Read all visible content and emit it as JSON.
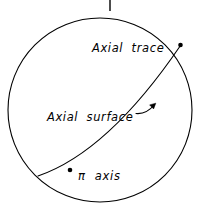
{
  "figure": {
    "type": "stereographic-projection-diagram",
    "width": 213,
    "height": 218,
    "background_color": "#ffffff",
    "stroke_color": "#000000"
  },
  "primitive_circle": {
    "name": "primitive-circle",
    "center_x": 100,
    "center_y": 110,
    "radius": 92,
    "stroke_width": 1.1
  },
  "north_tick": {
    "name": "north-index-tick",
    "x": 110,
    "y_top": 0,
    "y_bottom": 11,
    "stroke_width": 1.4
  },
  "great_circle": {
    "name": "axial-surface-great-circle",
    "start_point": {
      "x": 180.5,
      "y": 45.5
    },
    "end_point": {
      "x": 38.0,
      "y": 176.0
    },
    "control_point": {
      "x": 108.0,
      "y": 152.0
    },
    "stroke_width": 1.1
  },
  "markers": [
    {
      "name": "axial-trace-point",
      "x": 180.5,
      "y": 45.0,
      "radius": 2.3
    },
    {
      "name": "pi-axis-point",
      "x": 70.0,
      "y": 170.0,
      "radius": 2.3
    }
  ],
  "arrow": {
    "name": "axial-surface-pointer-arrow",
    "path_start": {
      "x": 136.0,
      "y": 112.0
    },
    "path_end": {
      "x": 155.5,
      "y": 104.0
    },
    "head_size": 4.2
  },
  "labels": {
    "axial_trace": {
      "text": "Axial  trace",
      "x": 92,
      "y": 52
    },
    "axial_surface": {
      "text": "Axial  surface",
      "x": 47,
      "y": 121
    },
    "pi_axis": {
      "text": "π  axis",
      "x": 78,
      "y": 180
    }
  }
}
